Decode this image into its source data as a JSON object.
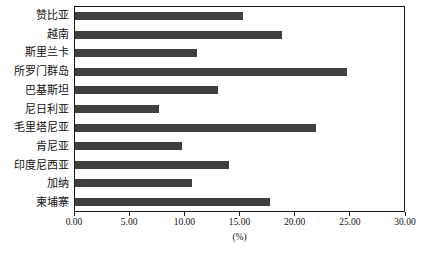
{
  "chart_data": {
    "type": "bar",
    "orientation": "horizontal",
    "title": "",
    "xlabel": "(%)",
    "ylabel": "",
    "xlim": [
      0,
      30
    ],
    "xticks": [
      "0.00",
      "5.00",
      "10.00",
      "15.00",
      "20.00",
      "25.00",
      "30.00"
    ],
    "xtick_values": [
      0,
      5,
      10,
      15,
      20,
      25,
      30
    ],
    "grid": false,
    "legend": null,
    "categories": [
      "赞比亚",
      "越南",
      "斯里兰卡",
      "所罗门群岛",
      "巴基斯坦",
      "尼日利亚",
      "毛里塔尼亚",
      "肯尼亚",
      "印度尼西亚",
      "加纳",
      "柬埔寨"
    ],
    "values": [
      15.3,
      18.9,
      11.1,
      24.8,
      13.0,
      7.7,
      22.0,
      9.8,
      14.0,
      10.7,
      17.8
    ],
    "series": [
      {
        "name": "",
        "values": [
          15.3,
          18.9,
          11.1,
          24.8,
          13.0,
          7.7,
          22.0,
          9.8,
          14.0,
          10.7,
          17.8
        ]
      }
    ]
  },
  "style": {
    "bar_color": "#3f3f3f",
    "axis_color": "#1a1a1a",
    "background": "#ffffff",
    "text_color": "#111111"
  }
}
